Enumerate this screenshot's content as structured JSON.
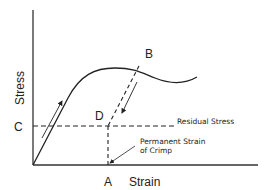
{
  "diagram": {
    "type": "stress-strain curve",
    "axes": {
      "y_label": "Stress",
      "x_label": "Strain"
    },
    "points": {
      "A": "A",
      "B": "B",
      "C": "C",
      "D": "D"
    },
    "annotations": {
      "residual_stress": "Residual Stress",
      "permanent_strain_line1": "Permanent Strain",
      "permanent_strain_line2": "of Crimp"
    },
    "colors": {
      "line": "#222222",
      "background": "#ffffff"
    }
  }
}
